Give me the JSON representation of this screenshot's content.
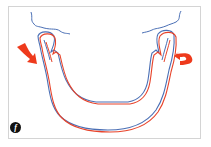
{
  "figure": {
    "panel_label": "f",
    "colors": {
      "outline_a": "#4a6fb5",
      "outline_b": "#e8432a",
      "arrow": "#ee3a1c",
      "frame": "#d4d4d4"
    },
    "elements": {
      "mandible_outline_blue": "mandible outline (blue)",
      "mandible_outline_red": "mandible outline (red, shifted)",
      "left_arrow": "curved arrow pointing down-right",
      "right_arrow": "curved arrow pointing left",
      "skull_base_lines": "blue contour lines of skull base"
    }
  }
}
